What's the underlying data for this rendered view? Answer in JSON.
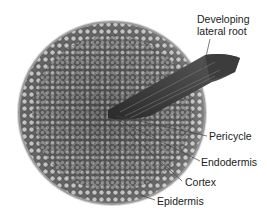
{
  "figure": {
    "labels": {
      "lateral_root_line1": "Developing",
      "lateral_root_line2": "lateral root",
      "pericycle": "Pericycle",
      "endodermis": "Endodermis",
      "cortex": "Cortex",
      "epidermis": "Epidermis"
    }
  }
}
